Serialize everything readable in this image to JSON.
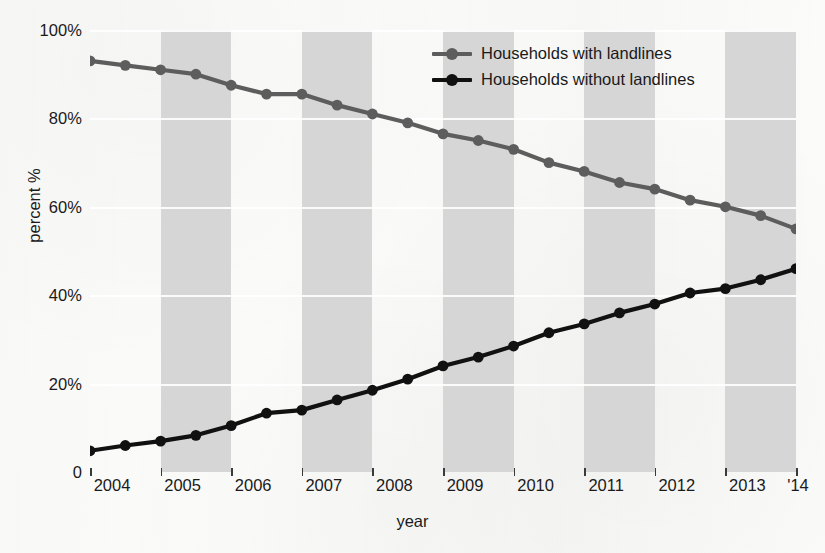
{
  "chart_data": {
    "type": "line",
    "title": "",
    "xlabel": "year",
    "ylabel": "percent %",
    "xlim": [
      2004,
      2014
    ],
    "ylim": [
      0,
      100
    ],
    "grid": true,
    "legend_position": "top-right",
    "x_tick_labels": [
      "2004",
      "2005",
      "2006",
      "2007",
      "2008",
      "2009",
      "2010",
      "2011",
      "2012",
      "2013",
      "'14"
    ],
    "y_tick_labels": [
      "100%",
      "80%",
      "60%",
      "40%",
      "20%",
      "0"
    ],
    "y_tick_values": [
      100,
      80,
      60,
      40,
      20,
      0
    ],
    "x": [
      2004,
      2004.5,
      2005,
      2005.5,
      2006,
      2006.5,
      2007,
      2007.5,
      2008,
      2008.5,
      2009,
      2009.5,
      2010,
      2010.5,
      2011,
      2011.5,
      2012,
      2012.5,
      2013,
      2013.5,
      2014
    ],
    "series": [
      {
        "name": "Households with landlines",
        "color": "#5d5d5d",
        "marker": "circle",
        "values": [
          93,
          92,
          91,
          90,
          87.5,
          85.5,
          85.5,
          83,
          81,
          79,
          76.5,
          75,
          73,
          70,
          68,
          65.5,
          64,
          61.5,
          60,
          58,
          55
        ]
      },
      {
        "name": "Households without landlines",
        "color": "#111111",
        "marker": "circle",
        "values": [
          4.8,
          6,
          7,
          8.3,
          10.5,
          13.3,
          14,
          16.3,
          18.5,
          21,
          24,
          26,
          28.5,
          31.5,
          33.5,
          36,
          38,
          40.5,
          41.5,
          43.5,
          46
        ]
      }
    ]
  },
  "legend": {
    "items": [
      {
        "label": "Households with landlines",
        "color": "#5d5d5d"
      },
      {
        "label": "Households without landlines",
        "color": "#111111"
      }
    ]
  },
  "axes": {
    "x_title": "year",
    "y_title": "percent %"
  }
}
